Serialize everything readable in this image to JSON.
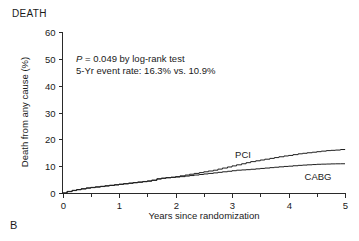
{
  "figure": {
    "panel_letter": "B",
    "panel_title": "DEATH"
  },
  "annotation": {
    "line1_stat": "P",
    "line1_rest": " = 0.049 by log-rank test",
    "line2": "5-Yr event rate: 16.3% vs. 10.9%"
  },
  "series_labels": {
    "pci": "PCI",
    "cabg": "CABG"
  },
  "axes": {
    "x_title": "Years since randomization",
    "y_title": "Death from any cause (%)",
    "x_ticks": [
      "0",
      "1",
      "2",
      "3",
      "4",
      "5"
    ],
    "y_ticks": [
      "0",
      "10",
      "20",
      "30",
      "40",
      "50",
      "60"
    ]
  },
  "chart_data": {
    "type": "line",
    "title": "DEATH",
    "subtitle": "P = 0.049 by log-rank test; 5-Yr event rate: 16.3% vs. 10.9%",
    "xlabel": "Years since randomization",
    "ylabel": "Death from any cause (%)",
    "xlim": [
      0,
      5
    ],
    "ylim": [
      0,
      60
    ],
    "xticks": [
      0,
      1,
      2,
      3,
      4,
      5
    ],
    "xminorticks": [
      0.5,
      1.5,
      2.5,
      3.5,
      4.5
    ],
    "yticks": [
      0,
      10,
      20,
      30,
      40,
      50,
      60
    ],
    "grid": false,
    "legend": "inline-curve-labels",
    "curve_style": "kaplan-meier-step",
    "annotations": [
      {
        "text": "P = 0.049 by log-rank test",
        "x": 0.35,
        "y": 45
      },
      {
        "text": "5-Yr event rate: 16.3% vs. 10.9%",
        "x": 0.35,
        "y": 41
      },
      {
        "text": "PCI",
        "x": 3.15,
        "y": 17.5
      },
      {
        "text": "CABG",
        "x": 4.3,
        "y": 8.5
      }
    ],
    "series": [
      {
        "name": "PCI",
        "color": "#1f1f1f",
        "final_value": 16.3,
        "x": [
          0,
          0.08,
          0.17,
          0.25,
          0.33,
          0.42,
          0.5,
          0.58,
          0.67,
          0.75,
          0.83,
          0.92,
          1.0,
          1.08,
          1.17,
          1.25,
          1.33,
          1.42,
          1.5,
          1.58,
          1.67,
          1.75,
          1.83,
          1.92,
          2.0,
          2.08,
          2.17,
          2.25,
          2.33,
          2.42,
          2.5,
          2.58,
          2.67,
          2.75,
          2.83,
          2.92,
          3.0,
          3.08,
          3.17,
          3.25,
          3.33,
          3.42,
          3.5,
          3.58,
          3.67,
          3.75,
          3.83,
          3.92,
          4.0,
          4.08,
          4.17,
          4.25,
          4.33,
          4.42,
          4.5,
          4.58,
          4.67,
          4.75,
          4.83,
          4.92,
          5.0
        ],
        "y": [
          0,
          0.5,
          0.9,
          1.2,
          1.5,
          1.8,
          2.0,
          2.2,
          2.4,
          2.6,
          2.8,
          3.0,
          3.2,
          3.4,
          3.6,
          3.8,
          4.0,
          4.2,
          4.4,
          4.7,
          5.2,
          5.5,
          5.7,
          5.9,
          6.1,
          6.4,
          6.7,
          7.0,
          7.3,
          7.6,
          7.9,
          8.2,
          8.5,
          8.9,
          9.3,
          9.7,
          10.1,
          10.5,
          10.9,
          11.3,
          11.7,
          12.0,
          12.3,
          12.6,
          12.9,
          13.2,
          13.5,
          13.8,
          14.0,
          14.3,
          14.6,
          14.8,
          15.0,
          15.2,
          15.4,
          15.6,
          15.8,
          15.9,
          16.0,
          16.2,
          16.3
        ]
      },
      {
        "name": "CABG",
        "color": "#1f1f1f",
        "final_value": 10.9,
        "x": [
          0,
          0.08,
          0.17,
          0.25,
          0.33,
          0.42,
          0.5,
          0.58,
          0.67,
          0.75,
          0.83,
          0.92,
          1.0,
          1.08,
          1.17,
          1.25,
          1.33,
          1.42,
          1.5,
          1.58,
          1.67,
          1.75,
          1.83,
          1.92,
          2.0,
          2.08,
          2.17,
          2.25,
          2.33,
          2.42,
          2.5,
          2.58,
          2.67,
          2.75,
          2.83,
          2.92,
          3.0,
          3.08,
          3.17,
          3.25,
          3.33,
          3.42,
          3.5,
          3.58,
          3.67,
          3.75,
          3.83,
          3.92,
          4.0,
          4.08,
          4.17,
          4.25,
          4.33,
          4.42,
          4.5,
          4.58,
          4.67,
          4.75,
          4.83,
          4.92,
          5.0
        ],
        "y": [
          0,
          0.6,
          1.0,
          1.3,
          1.6,
          1.9,
          2.1,
          2.3,
          2.5,
          2.7,
          2.9,
          3.1,
          3.3,
          3.5,
          3.7,
          3.9,
          4.1,
          4.3,
          4.5,
          4.8,
          5.3,
          5.5,
          5.7,
          5.8,
          5.95,
          6.1,
          6.3,
          6.5,
          6.7,
          6.9,
          7.1,
          7.3,
          7.5,
          7.7,
          7.9,
          8.1,
          8.3,
          8.5,
          8.6,
          8.7,
          8.85,
          9.0,
          9.15,
          9.3,
          9.45,
          9.6,
          9.75,
          9.9,
          10.0,
          10.15,
          10.3,
          10.4,
          10.5,
          10.6,
          10.7,
          10.75,
          10.8,
          10.85,
          10.88,
          10.9,
          10.9
        ]
      }
    ]
  }
}
